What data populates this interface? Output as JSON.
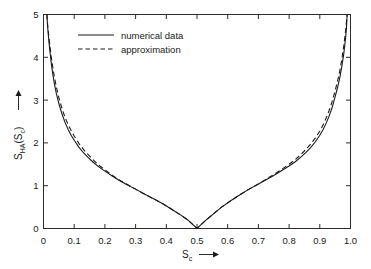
{
  "chart_data": {
    "type": "line",
    "title": "",
    "xlabel": "S_c",
    "xlabel_text": "S",
    "xlabel_sub": "c",
    "xlabel_arrow": "→",
    "ylabel": "S_HA(S_c)",
    "ylabel_part1": "S",
    "ylabel_sub1": "HA",
    "ylabel_part2": "(S",
    "ylabel_sub2": "c",
    "ylabel_part3": ")",
    "ylabel_arrow": "→",
    "xlim": [
      0,
      1
    ],
    "ylim": [
      0,
      5
    ],
    "grid": false,
    "legend_position": "upper-center-left",
    "xticks": [
      0,
      0.1,
      0.2,
      0.3,
      0.4,
      0.5,
      0.6,
      0.7,
      0.8,
      0.9,
      1.0
    ],
    "xticklabels": [
      "0",
      "0.1",
      "0.2",
      "0.3",
      "0.4",
      "0.5",
      "0.6",
      "0.7",
      "0.8",
      "0.9",
      "1.0"
    ],
    "yticks": [
      0,
      1,
      2,
      3,
      4,
      5
    ],
    "yticklabels": [
      "0",
      "1",
      "2",
      "3",
      "4",
      "5"
    ],
    "series": [
      {
        "name": "numerical data",
        "style": "solid",
        "x": [
          0.011,
          0.013,
          0.016,
          0.02,
          0.025,
          0.03,
          0.035,
          0.042,
          0.05,
          0.06,
          0.07,
          0.08,
          0.09,
          0.1,
          0.115,
          0.13,
          0.145,
          0.16,
          0.18,
          0.2,
          0.225,
          0.25,
          0.275,
          0.3,
          0.33,
          0.36,
          0.39,
          0.42,
          0.45,
          0.47,
          0.485,
          0.5,
          0.515,
          0.53,
          0.55,
          0.58,
          0.61,
          0.64,
          0.67,
          0.7,
          0.725,
          0.75,
          0.775,
          0.8,
          0.82,
          0.84,
          0.855,
          0.87,
          0.885,
          0.9,
          0.91,
          0.92,
          0.93,
          0.94,
          0.95,
          0.958,
          0.965,
          0.972,
          0.978,
          0.984,
          0.987,
          0.989
        ],
        "y": [
          5.0,
          4.75,
          4.5,
          4.2,
          3.88,
          3.62,
          3.4,
          3.15,
          2.92,
          2.68,
          2.48,
          2.32,
          2.18,
          2.06,
          1.9,
          1.77,
          1.66,
          1.56,
          1.44,
          1.34,
          1.22,
          1.11,
          1.01,
          0.92,
          0.8,
          0.69,
          0.57,
          0.44,
          0.3,
          0.2,
          0.1,
          0.0,
          0.1,
          0.2,
          0.32,
          0.5,
          0.65,
          0.79,
          0.92,
          1.04,
          1.14,
          1.24,
          1.35,
          1.46,
          1.56,
          1.68,
          1.78,
          1.89,
          2.02,
          2.18,
          2.3,
          2.45,
          2.62,
          2.82,
          3.08,
          3.3,
          3.52,
          3.8,
          4.08,
          4.45,
          4.7,
          5.0
        ]
      },
      {
        "name": "approximation",
        "style": "dashed",
        "x": [
          0.011,
          0.013,
          0.016,
          0.02,
          0.025,
          0.03,
          0.035,
          0.042,
          0.05,
          0.06,
          0.07,
          0.08,
          0.09,
          0.1,
          0.115,
          0.13,
          0.145,
          0.16,
          0.18,
          0.2,
          0.225,
          0.25,
          0.275,
          0.3,
          0.33,
          0.36,
          0.39,
          0.42,
          0.45,
          0.47,
          0.485,
          0.5,
          0.515,
          0.53,
          0.55,
          0.58,
          0.61,
          0.64,
          0.67,
          0.7,
          0.725,
          0.75,
          0.775,
          0.8,
          0.82,
          0.84,
          0.855,
          0.87,
          0.885,
          0.9,
          0.91,
          0.92,
          0.93,
          0.94,
          0.95,
          0.958,
          0.965,
          0.972,
          0.978,
          0.984,
          0.987,
          0.989
        ],
        "y": [
          5.0,
          4.8,
          4.58,
          4.32,
          4.02,
          3.78,
          3.56,
          3.3,
          3.06,
          2.81,
          2.6,
          2.43,
          2.29,
          2.16,
          1.99,
          1.85,
          1.73,
          1.62,
          1.48,
          1.37,
          1.24,
          1.12,
          1.02,
          0.92,
          0.8,
          0.69,
          0.57,
          0.44,
          0.3,
          0.2,
          0.1,
          0.0,
          0.1,
          0.2,
          0.32,
          0.5,
          0.65,
          0.79,
          0.92,
          1.04,
          1.15,
          1.26,
          1.38,
          1.5,
          1.61,
          1.74,
          1.85,
          1.97,
          2.11,
          2.28,
          2.41,
          2.57,
          2.75,
          2.96,
          3.22,
          3.45,
          3.68,
          3.96,
          4.26,
          4.62,
          4.84,
          5.0
        ]
      }
    ],
    "annotations": []
  },
  "legend": {
    "entries": [
      {
        "label": "numerical data",
        "style": "solid"
      },
      {
        "label": "approximation",
        "style": "dashed"
      }
    ]
  }
}
